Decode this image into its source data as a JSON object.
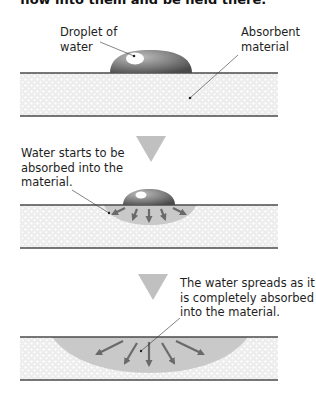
{
  "header": {
    "text": "flow into them and be held there."
  },
  "stages": [
    {
      "id": "stage-1",
      "labels": {
        "droplet": [
          "Droplet of",
          "water"
        ],
        "material": [
          "Absorbent",
          "material"
        ]
      }
    },
    {
      "id": "stage-2",
      "labels": {
        "absorb": [
          "Water starts to be",
          "absorbed into the",
          "material."
        ]
      }
    },
    {
      "id": "stage-3",
      "labels": {
        "spread": [
          "The water spreads as it",
          "is completely absorbed",
          "into the material."
        ]
      }
    }
  ],
  "colors": {
    "material_fill": "#ececec",
    "material_dots": "#ffffff",
    "layer_line": "#4a4a4a",
    "droplet_dark": "#5a5a5a",
    "droplet_light": "#b0b0b0",
    "wet_region": "#c9c9c9",
    "arrow": "#6a6a6a",
    "step_triangle": "#c0c0c0"
  }
}
